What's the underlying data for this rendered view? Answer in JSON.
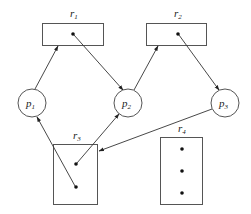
{
  "diagram": {
    "type": "resource-allocation-graph",
    "colors": {
      "stroke": "#555555",
      "edge": "#333333",
      "dot": "#111111",
      "background": "#ffffff"
    },
    "resources": [
      {
        "id": "r1",
        "base": "r",
        "sub": "1",
        "instances": 1
      },
      {
        "id": "r2",
        "base": "r",
        "sub": "2",
        "instances": 1
      },
      {
        "id": "r3",
        "base": "r",
        "sub": "3",
        "instances": 2
      },
      {
        "id": "r4",
        "base": "r",
        "sub": "4",
        "instances": 3
      }
    ],
    "processes": [
      {
        "id": "p1",
        "base": "p",
        "sub": "1"
      },
      {
        "id": "p2",
        "base": "p",
        "sub": "2"
      },
      {
        "id": "p3",
        "base": "p",
        "sub": "3"
      }
    ],
    "edges": [
      {
        "from": "p1",
        "to": "r1",
        "kind": "request"
      },
      {
        "from": "r1",
        "to": "p2",
        "kind": "assignment"
      },
      {
        "from": "p2",
        "to": "r2",
        "kind": "request"
      },
      {
        "from": "r2",
        "to": "p3",
        "kind": "assignment"
      },
      {
        "from": "p3",
        "to": "r3",
        "kind": "request"
      },
      {
        "from": "r3",
        "to": "p2",
        "kind": "assignment"
      },
      {
        "from": "r3",
        "to": "p1",
        "kind": "assignment"
      }
    ]
  }
}
